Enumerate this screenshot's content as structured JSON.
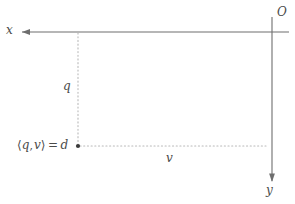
{
  "figure": {
    "type": "geometric-diagram",
    "background_color": "#ffffff",
    "line_color": "#6e6e6e",
    "dotted_color": "#b9b9b9",
    "text_color": "#4a4a4a",
    "marker_color": "#3a3a3a"
  },
  "axes": {
    "origin_label": "O",
    "horizontal": {
      "label": "x",
      "direction": "left",
      "start_px": [
        22,
        32
      ],
      "end_px": [
        288,
        32
      ]
    },
    "vertical": {
      "label": "y",
      "direction": "down",
      "start_px": [
        272,
        18
      ],
      "end_px": [
        272,
        182
      ]
    }
  },
  "guides": {
    "vertical_guide": {
      "label": "q",
      "from_px": [
        78,
        33
      ],
      "to_px": [
        78,
        146
      ]
    },
    "horizontal_guide": {
      "label": "v",
      "from_px": [
        79,
        146
      ],
      "to_px": [
        266,
        146
      ]
    }
  },
  "point": {
    "name": "intersection-point",
    "position_px": [
      78,
      146
    ],
    "equation": {
      "open_bracket": "⟨",
      "first_term": "q",
      "separator": ",",
      "second_term": "v",
      "close_bracket": "⟩",
      "operator": "=",
      "result": "d",
      "full": "⟨q, v⟩ = d"
    }
  }
}
